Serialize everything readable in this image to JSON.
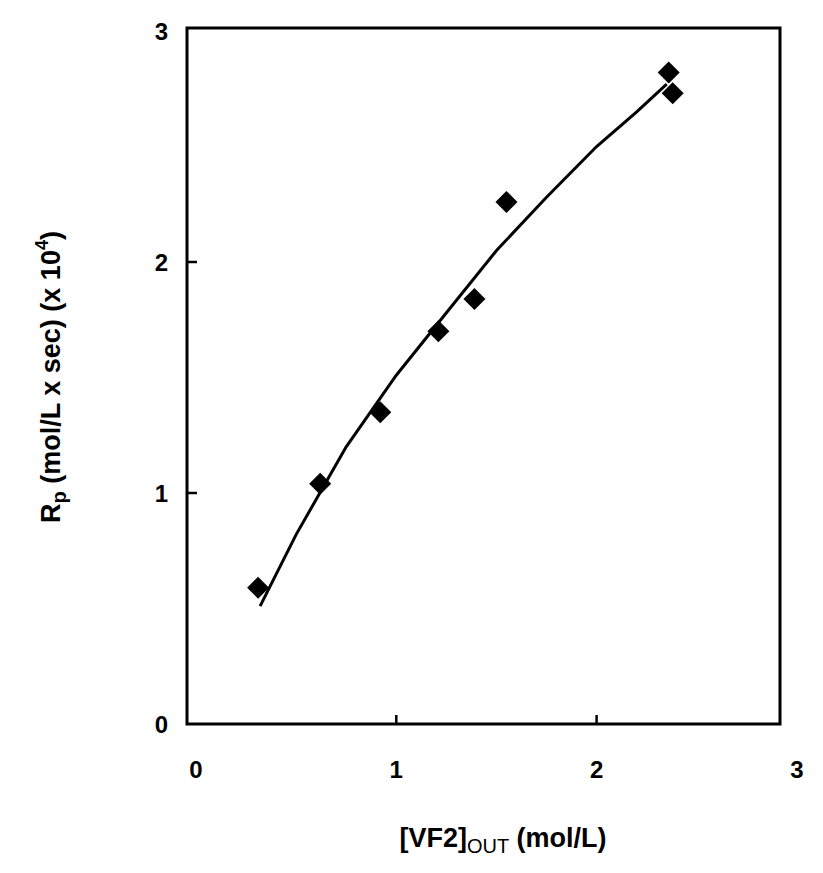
{
  "chart_data": {
    "type": "scatter",
    "title": "",
    "xlabel": "[VF2]OUT (mol/L)",
    "xlabel_parts": {
      "main": "[VF2]",
      "subscript": "OUT",
      "unit": " (mol/L)"
    },
    "ylabel": "Rp (mol/L x sec) (x 10^4)",
    "ylabel_parts": {
      "main": "R",
      "subscript": "p",
      "unit": " (mol/L x sec) (x 10",
      "superscript": "4",
      "end": ")"
    },
    "xlim": [
      0,
      3
    ],
    "ylim": [
      0,
      3
    ],
    "x_ticks": [
      "0",
      "1",
      "2",
      "3"
    ],
    "y_ticks": [
      "0",
      "1",
      "2",
      "3"
    ],
    "grid": false,
    "legend": null,
    "series": [
      {
        "name": "Rp data",
        "marker": "diamond",
        "color": "#000000",
        "x": [
          0.31,
          0.62,
          0.92,
          1.21,
          1.39,
          1.55,
          2.36,
          2.38
        ],
        "y": [
          0.59,
          1.04,
          1.35,
          1.7,
          1.84,
          2.26,
          2.82,
          2.73
        ]
      },
      {
        "name": "fit curve",
        "type": "line",
        "color": "#000000",
        "x": [
          0.32,
          0.5,
          0.75,
          1.0,
          1.25,
          1.5,
          1.75,
          2.0,
          2.2,
          2.35
        ],
        "y": [
          0.51,
          0.82,
          1.2,
          1.51,
          1.78,
          2.05,
          2.28,
          2.5,
          2.65,
          2.77
        ]
      }
    ]
  }
}
